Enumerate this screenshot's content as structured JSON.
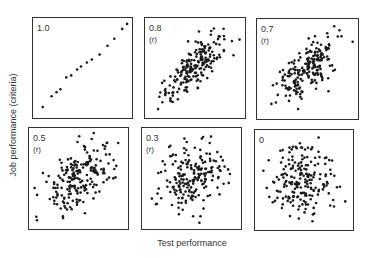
{
  "chart_data": {
    "type": "scatter",
    "title": "",
    "xlabel": "Test performance",
    "ylabel": "Job performance (criteria)",
    "grid": false,
    "legend": "none",
    "panels": [
      {
        "label": "1.0",
        "sublabel": "",
        "r": 1.0,
        "n": 15,
        "points": [
          [
            0.1,
            0.1
          ],
          [
            0.19,
            0.21
          ],
          [
            0.28,
            0.28
          ],
          [
            0.34,
            0.4
          ],
          [
            0.39,
            0.42
          ],
          [
            0.45,
            0.48
          ],
          [
            0.49,
            0.51
          ],
          [
            0.55,
            0.55
          ],
          [
            0.6,
            0.58
          ],
          [
            0.68,
            0.63
          ],
          [
            0.76,
            0.72
          ],
          [
            0.83,
            0.79
          ],
          [
            0.91,
            0.89
          ],
          [
            0.96,
            0.94
          ],
          [
            0.24,
            0.25
          ]
        ]
      },
      {
        "label": "0.8",
        "sublabel": "(r)",
        "r": 0.8,
        "n": 200
      },
      {
        "label": "0.7",
        "sublabel": "(r)",
        "r": 0.7,
        "n": 200
      },
      {
        "label": "0.5",
        "sublabel": "(r)",
        "r": 0.5,
        "n": 200
      },
      {
        "label": "0.3",
        "sublabel": "(r)",
        "r": 0.3,
        "n": 200
      },
      {
        "label": "0",
        "sublabel": "",
        "r": 0.0,
        "n": 200
      }
    ]
  },
  "axes": {
    "x_title": "Test performance",
    "y_title": "Job performance (criteria)"
  }
}
